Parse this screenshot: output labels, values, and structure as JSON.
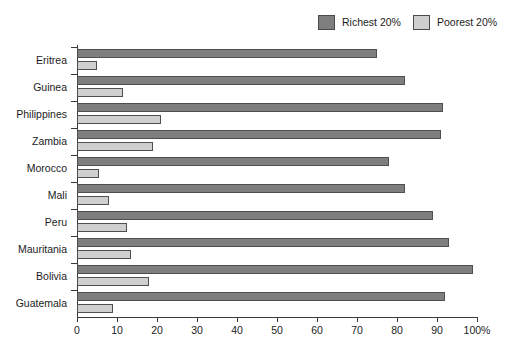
{
  "chart_data": {
    "type": "bar",
    "orientation": "horizontal",
    "title": "",
    "xlabel": "",
    "ylabel": "",
    "xlim": [
      0,
      100
    ],
    "xunit": "%",
    "grid": false,
    "legend_position": "top-right",
    "categories": [
      "Eritrea",
      "Guinea",
      "Philippines",
      "Zambia",
      "Morocco",
      "Mali",
      "Peru",
      "Mauritania",
      "Bolivia",
      "Guatemala"
    ],
    "xticks": [
      0,
      10,
      20,
      30,
      40,
      50,
      60,
      70,
      80,
      90,
      100
    ],
    "xtick_labels": [
      "0",
      "10",
      "20",
      "30",
      "40",
      "50",
      "60",
      "70",
      "80",
      "90",
      "100%"
    ],
    "series": [
      {
        "name": "Richest 20%",
        "color": "#7e7e7e",
        "values": [
          75,
          82,
          91.5,
          91,
          78,
          82,
          89,
          93,
          99,
          92
        ]
      },
      {
        "name": "Poorest 20%",
        "color": "#cfcfcf",
        "values": [
          5,
          11.5,
          21,
          19,
          5.5,
          8,
          12.5,
          13.5,
          18,
          9
        ]
      }
    ]
  },
  "legend": {
    "entries": [
      {
        "label": "Richest 20%",
        "swatch": "rich"
      },
      {
        "label": "Poorest 20%",
        "swatch": "poor"
      }
    ]
  }
}
